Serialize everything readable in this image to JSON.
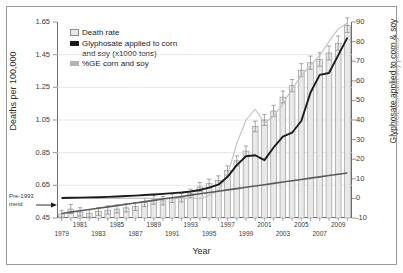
{
  "figure": {
    "xaxis_title": "Year",
    "yaxis_title_left": "Deaths per 100,000",
    "yaxis_title_right_primary": "Glyphosate applied to corn & soy",
    "yaxis_title_right_secondary": "%GE corn and soy planted",
    "annotation": "Pre-1993 trend"
  },
  "legend": {
    "items": [
      {
        "label": "Death rate",
        "swatch": "light-gray-box",
        "color": "#e9e9e9"
      },
      {
        "label": "Glyphosate applied to corn",
        "label2": "and soy (x1000 tons)",
        "swatch": "black-bar",
        "color": "#1c1c1c"
      },
      {
        "label": "%GE corn and soy",
        "swatch": "gray-bar",
        "color": "#b4b4b4"
      }
    ]
  },
  "chart_data": {
    "type": "bar",
    "title": "",
    "xlabel": "Year",
    "ylabel": "Deaths per 100,000",
    "ylabel_right": "Glyphosate applied to corn & soy",
    "grid": true,
    "legend_position": "top-left",
    "ylim": [
      0.45,
      1.65
    ],
    "ylim_right": [
      -10,
      90
    ],
    "yticks": [
      "0.45",
      "0.65",
      "0.85",
      "1.05",
      "1.25",
      "1.45",
      "1.65"
    ],
    "yticks_right": [
      "-10",
      "0",
      "10",
      "20",
      "30",
      "40",
      "50",
      "60",
      "70",
      "80",
      "90"
    ],
    "categories": [
      1979,
      1980,
      1981,
      1982,
      1983,
      1984,
      1985,
      1986,
      1987,
      1988,
      1989,
      1990,
      1991,
      1992,
      1993,
      1994,
      1995,
      1996,
      1997,
      1998,
      1999,
      2000,
      2001,
      2002,
      2003,
      2004,
      2005,
      2006,
      2007,
      2008,
      2009,
      2010
    ],
    "xtick_labels_upper": [
      1981,
      1985,
      1989,
      1993,
      1997,
      2001,
      2005,
      2009
    ],
    "xtick_labels_lower": [
      1979,
      1983,
      1987,
      1991,
      1995,
      1999,
      2003,
      2007
    ],
    "series": [
      {
        "name": "Death rate",
        "type": "bar",
        "axis": "left",
        "color": "#e9e9e9",
        "values": [
          0.475,
          0.505,
          0.487,
          0.478,
          0.49,
          0.498,
          0.505,
          0.512,
          0.52,
          0.545,
          0.56,
          0.555,
          0.57,
          0.575,
          0.6,
          0.64,
          0.66,
          0.68,
          0.74,
          0.8,
          0.86,
          1.01,
          1.05,
          1.105,
          1.19,
          1.26,
          1.355,
          1.4,
          1.42,
          1.46,
          1.52,
          1.63
        ],
        "error_low": [
          0.455,
          0.478,
          0.462,
          0.455,
          0.466,
          0.473,
          0.481,
          0.487,
          0.496,
          0.52,
          0.534,
          0.53,
          0.545,
          0.549,
          0.574,
          0.614,
          0.633,
          0.653,
          0.712,
          0.771,
          0.83,
          0.978,
          1.017,
          1.071,
          1.154,
          1.223,
          1.316,
          1.36,
          1.379,
          1.418,
          1.477,
          1.586
        ],
        "error_high": [
          0.497,
          0.533,
          0.513,
          0.502,
          0.515,
          0.524,
          0.53,
          0.538,
          0.545,
          0.571,
          0.587,
          0.581,
          0.596,
          0.602,
          0.627,
          0.667,
          0.688,
          0.708,
          0.769,
          0.83,
          0.891,
          1.043,
          1.084,
          1.14,
          1.227,
          1.298,
          1.395,
          1.441,
          1.462,
          1.503,
          1.564,
          1.675
        ]
      },
      {
        "name": "Glyphosate applied to corn and soy (x1000 tons)",
        "type": "line",
        "axis": "right",
        "color": "#1c1c1c",
        "values": [
          0.2,
          0.3,
          0.4,
          0.5,
          0.6,
          0.8,
          1.0,
          1.2,
          1.4,
          1.7,
          2.0,
          2.3,
          2.7,
          3.0,
          3.5,
          4.3,
          5.5,
          7.0,
          11.0,
          17.0,
          21.5,
          22.0,
          19.5,
          26.0,
          31.5,
          33.5,
          39.5,
          54.0,
          63.0,
          64.0,
          73.0,
          82.0
        ]
      },
      {
        "name": "%GE corn and soy",
        "type": "line",
        "axis": "right",
        "color": "#c2c2c2",
        "values": [
          0,
          0,
          0,
          0,
          0,
          0,
          0,
          0,
          0,
          0,
          0,
          0,
          0,
          0,
          0,
          0,
          1.5,
          4.0,
          12.0,
          28.0,
          40.0,
          45.5,
          38.5,
          42.0,
          48.0,
          56.0,
          62.5,
          68.0,
          73.0,
          80.0,
          86.5,
          89.5
        ]
      },
      {
        "name": "Pre-1993 trend",
        "type": "line",
        "axis": "left",
        "color": "#5a5a5a",
        "values": [
          0.478,
          0.486,
          0.494,
          0.502,
          0.51,
          0.518,
          0.526,
          0.534,
          0.542,
          0.55,
          0.558,
          0.566,
          0.574,
          0.582,
          0.59,
          0.598,
          0.606,
          0.614,
          0.622,
          0.63,
          0.638,
          0.646,
          0.654,
          0.662,
          0.67,
          0.678,
          0.686,
          0.694,
          0.702,
          0.71,
          0.718,
          0.726
        ]
      }
    ]
  }
}
